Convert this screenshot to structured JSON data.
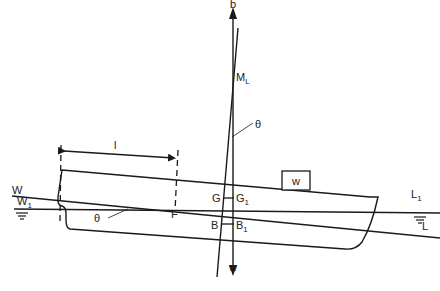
{
  "diagram": {
    "labels": {
      "b": "b",
      "ml_main": "M",
      "ml_sub": "L",
      "theta_top": "θ",
      "theta_bottom": "θ",
      "l": "l",
      "w_weight": "w",
      "w_bottom": "w",
      "G": "G",
      "G1_main": "G",
      "G1_sub": "1",
      "B": "B",
      "B1_main": "B",
      "B1_sub": "1",
      "F": "F",
      "W": "W",
      "W1_main": "W",
      "W1_sub": "1",
      "L1_main": "L",
      "L1_sub": "1",
      "L": "L"
    },
    "colors": {
      "line": "#1a1a1a",
      "background": "#ffffff"
    }
  }
}
